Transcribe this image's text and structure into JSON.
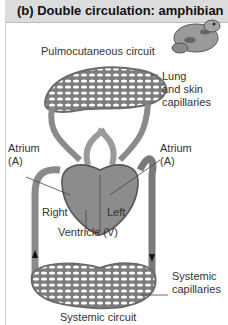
{
  "header": {
    "title": "(b) Double circulation: amphibian"
  },
  "labels": {
    "pulmonary_circuit": "Pulmocutaneous circuit",
    "lung_cap_1": "Lung",
    "lung_cap_2": "and skin",
    "lung_cap_3": "capillaries",
    "atrium_left_1": "Atrium",
    "atrium_left_2": "(A)",
    "atrium_right_1": "Atrium",
    "atrium_right_2": "(A)",
    "right": "Right",
    "left": "Left",
    "ventricle": "Ventricle (V)",
    "systemic_cap_1": "Systemic",
    "systemic_cap_2": "capillaries",
    "systemic_circuit": "Systemic circuit"
  },
  "colors": {
    "header_bg": "#dcdcdc",
    "vessel": "#8a8a8a",
    "vessel_dark": "#5a5a5a",
    "text": "#333333"
  }
}
